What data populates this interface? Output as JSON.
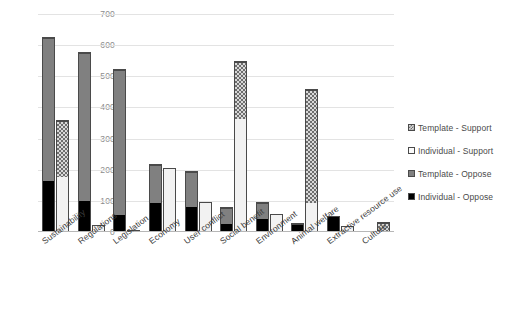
{
  "chart_data": {
    "type": "bar",
    "title": "",
    "subtitle": "",
    "xlabel": "",
    "ylabel": "",
    "ylim": [
      0,
      700
    ],
    "ytick_step": 100,
    "yticks": [
      "700",
      "600",
      "500",
      "400",
      "300",
      "200",
      "100",
      "0"
    ],
    "grid": true,
    "stacked": true,
    "bar_pairs": true,
    "legend_position": "right",
    "categories": [
      "Sustainability",
      "Regulations",
      "Legislation",
      "Economy",
      "User conflict",
      "Social benefit",
      "Environment",
      "Animal welfare",
      "Extractive resource use",
      "Culture"
    ],
    "series": [
      {
        "name": "Individual - Oppose",
        "stack": "oppose",
        "color": "#000000",
        "values": [
          162,
          96,
          53,
          93,
          80,
          25,
          42,
          25,
          53,
          0
        ]
      },
      {
        "name": "Template - Oppose",
        "stack": "oppose",
        "color": "#808080",
        "values": [
          463,
          482,
          472,
          126,
          115,
          55,
          54,
          3,
          0,
          0
        ]
      },
      {
        "name": "Individual - Support",
        "stack": "support",
        "color": "#F2F2F2",
        "values": [
          176,
          22,
          5,
          207,
          95,
          364,
          58,
          92,
          18,
          0
        ]
      },
      {
        "name": "Template - Support",
        "stack": "support",
        "color": "#D9D9D9",
        "values": [
          183,
          0,
          0,
          0,
          0,
          184,
          0,
          368,
          0,
          32
        ]
      }
    ],
    "stack_totals": {
      "oppose": [
        625,
        578,
        525,
        219,
        195,
        80,
        96,
        28,
        53,
        0
      ],
      "support": [
        359,
        22,
        5,
        207,
        95,
        548,
        58,
        460,
        18,
        32
      ]
    }
  },
  "legend": {
    "items": [
      {
        "label": "Template - Support",
        "swatch": "tpl-sup"
      },
      {
        "label": "Individual - Support",
        "swatch": "ind-sup"
      },
      {
        "label": "Template - Oppose",
        "swatch": "tpl-opp"
      },
      {
        "label": "Individual - Oppose",
        "swatch": "ind-opp"
      }
    ]
  }
}
